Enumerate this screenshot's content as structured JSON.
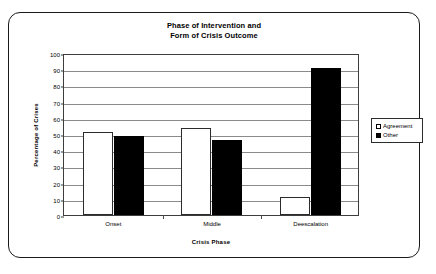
{
  "chart_data": {
    "type": "bar",
    "title": "Phase of Intervention and Form of Crisis Outcome",
    "title_lines": [
      "Phase of Intervention and",
      "Form of Crisis Outcome"
    ],
    "xlabel": "Crisis Phase",
    "ylabel": "Percentage of Crises",
    "categories": [
      "Onset",
      "Middle",
      "Deescalation"
    ],
    "series": [
      {
        "name": "Agreement",
        "values": [
          51,
          54,
          11
        ],
        "color": "#ffffff",
        "edge_color": "#2b2b2b"
      },
      {
        "name": "Other",
        "values": [
          49,
          46,
          91
        ],
        "color": "#000000",
        "edge_color": "#000000"
      }
    ],
    "ylim": [
      0,
      100
    ],
    "ytick_step": 10,
    "yticks": [
      0,
      10,
      20,
      30,
      40,
      50,
      60,
      70,
      80,
      90,
      100
    ],
    "grid": "horizontal",
    "legend_position": "right-outside",
    "background": "#ffffff",
    "frame_border_color": "#1a1a1a"
  }
}
